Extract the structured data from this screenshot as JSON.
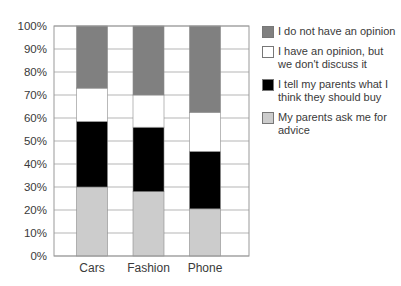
{
  "chart_data": {
    "type": "bar",
    "stacked": true,
    "title": "",
    "xlabel": "",
    "ylabel": "",
    "categories": [
      "Cars",
      "Fashion",
      "Phone"
    ],
    "ylim": [
      0,
      100
    ],
    "y_ticks": [
      "0%",
      "10%",
      "20%",
      "30%",
      "40%",
      "50%",
      "60%",
      "70%",
      "80%",
      "90%",
      "100%"
    ],
    "grid": true,
    "legend_position": "right",
    "series": [
      {
        "name": "My parents ask me for advice",
        "color": "#cccccc",
        "values": [
          30,
          28,
          20.5
        ]
      },
      {
        "name": "I tell my parents what I think they should buy",
        "color": "#000000",
        "values": [
          28.5,
          28,
          25
        ]
      },
      {
        "name": "I have an opinion, but we don't discuss it",
        "color": "#ffffff",
        "values": [
          14.5,
          14,
          17
        ]
      },
      {
        "name": "I do not have an opinion",
        "color": "#808080",
        "values": [
          27,
          30,
          37.5
        ]
      }
    ]
  },
  "legend": [
    {
      "label_lines": [
        "I do not have an opinion"
      ],
      "color": "#808080"
    },
    {
      "label_lines": [
        "I have an opinion, but",
        "we don't discuss it"
      ],
      "color": "#ffffff"
    },
    {
      "label_lines": [
        "I tell my parents what I",
        "think they should buy"
      ],
      "color": "#000000"
    },
    {
      "label_lines": [
        "My parents ask me for",
        "advice"
      ],
      "color": "#cccccc"
    }
  ]
}
